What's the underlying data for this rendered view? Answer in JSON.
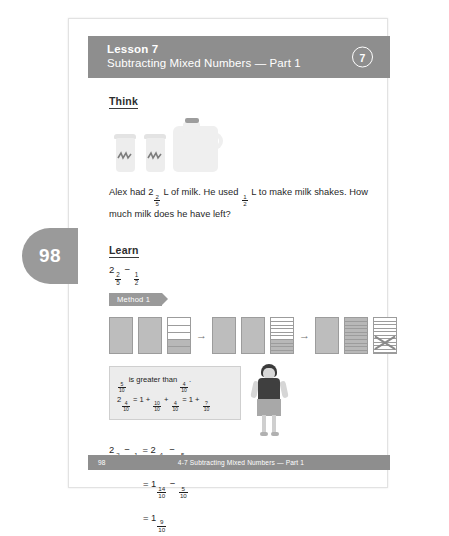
{
  "page": {
    "side_tab_number": "98",
    "lesson_label": "Lesson 7",
    "lesson_title": "Subtracting Mixed Numbers — Part 1",
    "lesson_badge": "7"
  },
  "think": {
    "heading": "Think",
    "illustration": [
      "milk-shake-cup",
      "milk-shake-cup",
      "milk-jug"
    ],
    "problem_text": "Alex had 2 ⅖ L of milk. He used ½ L to make milk shakes. How much milk does he have left?",
    "problem_parts": {
      "before_first": "Alex had 2",
      "first_fraction": {
        "numerator": "2",
        "denominator": "5"
      },
      "middle": " L of milk. He used ",
      "second_fraction": {
        "numerator": "1",
        "denominator": "2"
      },
      "after": " L to make milk shakes. How much milk does he have left?"
    }
  },
  "learn": {
    "heading": "Learn",
    "expression": {
      "whole": "2",
      "fraction": {
        "numerator": "2",
        "denominator": "5"
      },
      "operator": "−",
      "fraction2": {
        "numerator": "1",
        "denominator": "2"
      }
    },
    "method_banner": "Method 1"
  },
  "bar_models": {
    "groups": [
      {
        "name": "group-1",
        "bars": [
          {
            "type": "solid",
            "segments": 1,
            "filled": 1
          },
          {
            "type": "solid",
            "segments": 1,
            "filled": 1
          },
          {
            "type": "divided",
            "segments": 5,
            "filled": 2
          }
        ]
      },
      {
        "name": "group-2",
        "bars": [
          {
            "type": "solid",
            "segments": 1,
            "filled": 1
          },
          {
            "type": "solid",
            "segments": 1,
            "filled": 1
          },
          {
            "type": "divided",
            "segments": 10,
            "filled": 4
          }
        ]
      },
      {
        "name": "group-3",
        "bars": [
          {
            "type": "solid",
            "segments": 1,
            "filled": 1
          },
          {
            "type": "divided",
            "segments": 10,
            "filled": 10
          },
          {
            "type": "divided-crossed",
            "segments": 10,
            "filled": 0,
            "crossed": true
          }
        ]
      }
    ],
    "arrow_glyph": "→"
  },
  "callout": {
    "line1": {
      "fraction_a": {
        "numerator": "5",
        "denominator": "10"
      },
      "text": " is greater than ",
      "fraction_b": {
        "numerator": "4",
        "denominator": "10"
      },
      "period": "."
    },
    "line2": {
      "whole": "2",
      "f1": {
        "numerator": "4",
        "denominator": "10"
      },
      "eq1": " = 1 + ",
      "f2": {
        "numerator": "10",
        "denominator": "10"
      },
      "plus1": " + ",
      "f3": {
        "numerator": "4",
        "denominator": "10"
      },
      "eq2": " = 1 + ",
      "f4": {
        "numerator": "?",
        "denominator": "10"
      }
    },
    "character": "girl-student"
  },
  "equations": [
    {
      "name": "equation-line-1",
      "whole1": "2",
      "f1": {
        "numerator": "2",
        "denominator": "5"
      },
      "op1": " − ",
      "f2": {
        "numerator": "1",
        "denominator": "2"
      },
      "eq": " = 2",
      "f3": {
        "numerator": "4",
        "denominator": "10"
      },
      "op2": " − ",
      "f4": {
        "numerator": "5",
        "denominator": "10"
      }
    },
    {
      "name": "equation-line-2",
      "eq": "= 1",
      "f3": {
        "numerator": "14",
        "denominator": "10"
      },
      "op2": " − ",
      "f4": {
        "numerator": "5",
        "denominator": "10"
      }
    },
    {
      "name": "equation-line-3",
      "eq": "= 1",
      "f3": {
        "numerator": "9",
        "denominator": "10"
      }
    }
  ],
  "footer": {
    "page_number": "98",
    "title": "4-7  Subtracting Mixed Numbers — Part 1"
  },
  "colors": {
    "bar_grey": "#8e8e8e",
    "tab_grey": "#9a9a9a",
    "fill_grey": "#b8b8b8",
    "callout_bg": "#ececec"
  }
}
